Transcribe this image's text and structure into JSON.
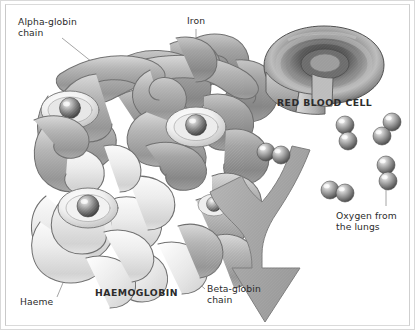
{
  "figure": {
    "background_color": "#ffffff",
    "frame_color": "#d9d9d9",
    "ink_color": "#2b2b2b",
    "leader_line_color": "#8a8a8a"
  },
  "labels": {
    "alpha_globin": "Alpha-globin\nchain",
    "iron": "Iron",
    "red_blood_cell": "RED BLOOD CELL",
    "haemoglobin": "HAEMOGLOBIN",
    "beta_globin": "Beta-globin\nchain",
    "haeme": "Haeme",
    "oxygen_from_lungs": "Oxygen from\nthe lungs"
  },
  "elements": {
    "protein_label": "haemoglobin-protein-ribbon-model",
    "red_blood_cell_label": "red-blood-cell-cutaway-torus",
    "arrow_label": "oxygen-flow-arrow",
    "oxygen_molecule_label": "oxygen-molecule-o2"
  },
  "colors": {
    "ribbon_dark": "#8e8e8e",
    "ribbon_mid": "#a8a8a8",
    "ribbon_light": "#e2e2e2",
    "ribbon_outline": "#6f6f6f",
    "cell_dark": "#4a4a4a",
    "cell_mid": "#9a9a9a",
    "cell_light": "#d6d6d6",
    "arrow_fill": "#a9a9a9",
    "arrow_outline": "#7d7d7d",
    "sphere_dark": "#5c5c5c",
    "sphere_light": "#cfcfcf"
  },
  "oxygen_molecules": [
    {
      "id": "o2-1",
      "x": 272,
      "y": 152,
      "orientation": "horizontal"
    },
    {
      "id": "o2-2",
      "x": 345,
      "y": 133,
      "orientation": "vertical"
    },
    {
      "id": "o2-3",
      "x": 390,
      "y": 129,
      "orientation": "diagonal"
    },
    {
      "id": "o2-4",
      "x": 336,
      "y": 188,
      "orientation": "horizontal"
    },
    {
      "id": "o2-5",
      "x": 386,
      "y": 174,
      "orientation": "vertical"
    }
  ],
  "leader_lines": [
    {
      "id": "leader-alpha-globin",
      "from": [
        62,
        37
      ],
      "to": [
        108,
        75
      ]
    },
    {
      "id": "leader-iron",
      "from": [
        196,
        28
      ],
      "to": [
        196,
        122
      ]
    },
    {
      "id": "leader-red-blood-cell",
      "from": [
        232,
        112
      ],
      "to": [
        290,
        82
      ]
    },
    {
      "id": "leader-beta-globin",
      "from": [
        205,
        287
      ],
      "to": [
        175,
        262
      ]
    },
    {
      "id": "leader-haeme",
      "from": [
        58,
        298
      ],
      "to": [
        88,
        222
      ]
    },
    {
      "id": "leader-oxygen",
      "from": [
        386,
        204
      ],
      "to": [
        386,
        186
      ]
    }
  ]
}
